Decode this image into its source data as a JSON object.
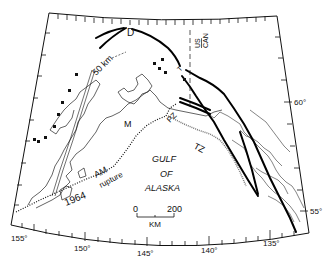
{
  "map": {
    "title": "",
    "region_labels": {
      "gulf_line1": "GULF",
      "gulf_line2": "OF",
      "gulf_line3": "ALASKA"
    },
    "feature_labels": {
      "denali": "D",
      "fifty_km": "50 km",
      "us": "US",
      "can": "CAN",
      "m": "M",
      "pz": "PZ",
      "tz": "TZ",
      "t": "T",
      "am": "AM",
      "rupture": "rupture",
      "year": "1964"
    },
    "scale_bar": {
      "start": "0",
      "end": "200",
      "unit": "KM"
    },
    "longitude_labels": [
      "155°",
      "150°",
      "145°",
      "140°",
      "135°"
    ],
    "latitude_labels": [
      "60°",
      "55°"
    ],
    "colors": {
      "ink": "#111111",
      "background": "#ffffff",
      "hatch": "#888888"
    }
  }
}
